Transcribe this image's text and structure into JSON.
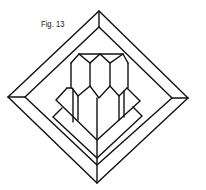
{
  "figure": {
    "label": "Fig. 13",
    "stroke_color": "#111111",
    "background_color": "#ffffff"
  }
}
